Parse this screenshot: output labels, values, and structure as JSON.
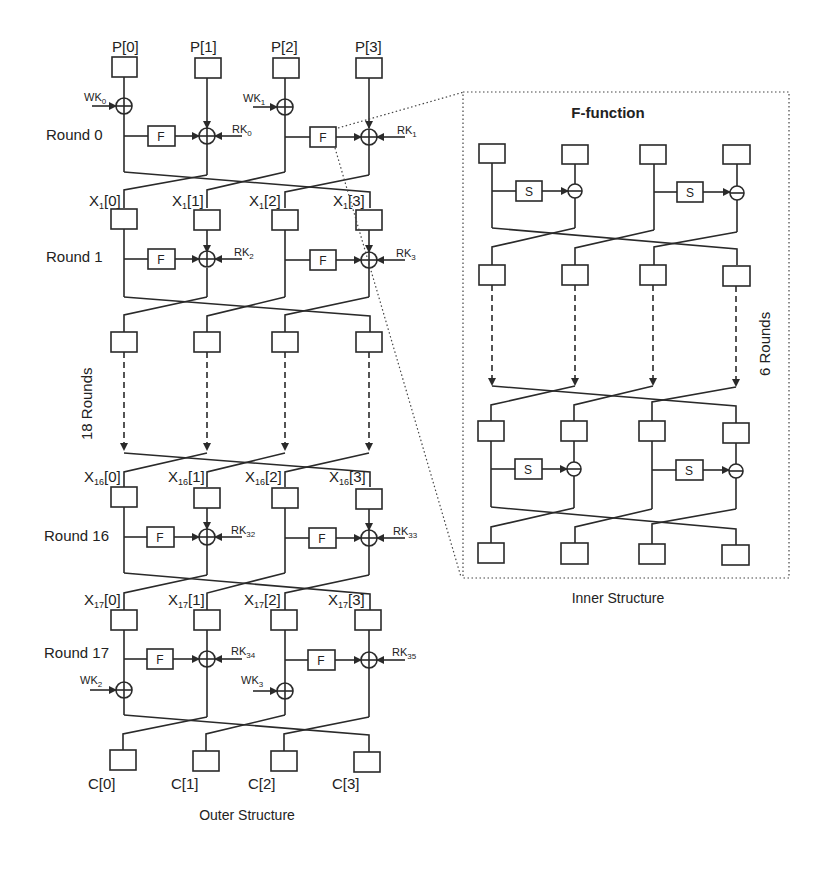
{
  "outer": {
    "caption": "Outer Structure",
    "inputs": [
      "P[0]",
      "P[1]",
      "P[2]",
      "P[3]"
    ],
    "outputs": [
      "C[0]",
      "C[1]",
      "C[2]",
      "C[3]"
    ],
    "x1_labels": [
      "X",
      "X",
      "X",
      "X"
    ],
    "x1_sub": "1",
    "x1_idx": [
      "[0]",
      "[1]",
      "[2]",
      "[3]"
    ],
    "x16_sub": "16",
    "x17_sub": "17",
    "rounds": [
      {
        "label": "Round 0",
        "rk_left": "RK",
        "rk_left_sub": "0",
        "rk_right": "RK",
        "rk_right_sub": "1"
      },
      {
        "label": "Round 1",
        "rk_left": "RK",
        "rk_left_sub": "2",
        "rk_right": "RK",
        "rk_right_sub": "3"
      },
      {
        "label": "Round 16",
        "rk_left": "RK",
        "rk_left_sub": "32",
        "rk_right": "RK",
        "rk_right_sub": "33"
      },
      {
        "label": "Round 17",
        "rk_left": "RK",
        "rk_left_sub": "34",
        "rk_right": "RK",
        "rk_right_sub": "35"
      }
    ],
    "whitening": [
      {
        "label": "WK",
        "sub": "0"
      },
      {
        "label": "WK",
        "sub": "1"
      },
      {
        "label": "WK",
        "sub": "2"
      },
      {
        "label": "WK",
        "sub": "3"
      }
    ],
    "f_label": "F",
    "repeat_label": "18 Rounds"
  },
  "inner": {
    "title": "F-function",
    "caption": "Inner Structure",
    "s_label": "S",
    "repeat_label": "6 Rounds"
  }
}
